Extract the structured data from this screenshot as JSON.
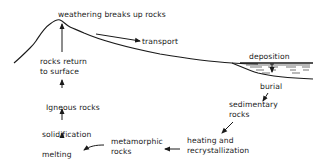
{
  "diagram": {
    "labels": {
      "weathering": "weathering breaks up rocks",
      "transport": "transport",
      "deposition": "deposition",
      "burial": "burial",
      "sedimentary_1": "sedimentary",
      "sedimentary_2": "rocks",
      "heating_1": "heating and",
      "heating_2": "recrystallization",
      "metamorphic_1": "metamorphic",
      "metamorphic_2": "rocks",
      "melting": "melting",
      "solidification": "solidification",
      "igneous": "Igneous rocks",
      "return_1": "rocks return",
      "return_2": "to surface"
    },
    "colors": {
      "ink": "#1a1a1a",
      "background": "#ffffff"
    }
  }
}
